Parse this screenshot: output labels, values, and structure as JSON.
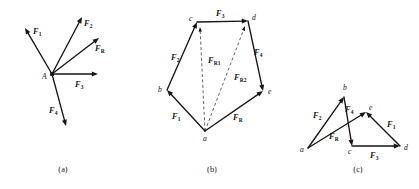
{
  "figure": {
    "background_color": "#ffffff",
    "line_color": "#161616",
    "dashed_color": "#4a4a4a",
    "width": 419,
    "height": 189
  },
  "panels": [
    {
      "id": "a",
      "caption": "(a)",
      "caption_x": 63,
      "caption_y": 172,
      "description": "Concurrent force system at point A",
      "origin": {
        "label": "A",
        "x": 52,
        "y": 74,
        "label_x": 42,
        "label_y": 79
      },
      "vectors": [
        {
          "name": "F1",
          "label": "F",
          "sub": "1",
          "x1": 52,
          "y1": 74,
          "x2": 25,
          "y2": 28,
          "label_x": 33,
          "label_y": 34,
          "style": "solid"
        },
        {
          "name": "F2",
          "label": "F",
          "sub": "2",
          "x1": 52,
          "y1": 74,
          "x2": 82,
          "y2": 17,
          "label_x": 84,
          "label_y": 26,
          "style": "solid"
        },
        {
          "name": "FR",
          "label": "F",
          "sub": "R",
          "x1": 52,
          "y1": 74,
          "x2": 99,
          "y2": 38,
          "label_x": 95,
          "label_y": 51,
          "style": "solid"
        },
        {
          "name": "F3",
          "label": "F",
          "sub": "3",
          "x1": 52,
          "y1": 74,
          "x2": 98,
          "y2": 74,
          "label_x": 75,
          "label_y": 87,
          "style": "solid"
        },
        {
          "name": "F4",
          "label": "F",
          "sub": "4",
          "x1": 52,
          "y1": 74,
          "x2": 66,
          "y2": 126,
          "label_x": 49,
          "label_y": 113,
          "style": "solid"
        }
      ],
      "points": [],
      "dashed": []
    },
    {
      "id": "b",
      "caption": "(b)",
      "caption_x": 212,
      "caption_y": 172,
      "description": "Force polygon a-b-c-d-e with partial resultants",
      "origin": null,
      "points": [
        {
          "label": "a",
          "x": 205,
          "y": 131,
          "label_x": 203,
          "label_y": 141
        },
        {
          "label": "b",
          "x": 167,
          "y": 90,
          "label_x": 158,
          "label_y": 92
        },
        {
          "label": "c",
          "x": 197,
          "y": 22,
          "label_x": 189,
          "label_y": 21
        },
        {
          "label": "d",
          "x": 248,
          "y": 21,
          "label_x": 252,
          "label_y": 20
        },
        {
          "label": "e",
          "x": 263,
          "y": 91,
          "label_x": 268,
          "label_y": 94
        }
      ],
      "vectors": [
        {
          "name": "F1",
          "label": "F",
          "sub": "1",
          "x1": 205,
          "y1": 131,
          "x2": 167,
          "y2": 90,
          "label_x": 172,
          "label_y": 119,
          "style": "solid"
        },
        {
          "name": "F2",
          "label": "F",
          "sub": "2",
          "x1": 167,
          "y1": 90,
          "x2": 197,
          "y2": 22,
          "label_x": 171,
          "label_y": 60,
          "style": "solid"
        },
        {
          "name": "F3",
          "label": "F",
          "sub": "3",
          "x1": 197,
          "y1": 22,
          "x2": 248,
          "y2": 21,
          "label_x": 216,
          "label_y": 16,
          "style": "solid"
        },
        {
          "name": "F4",
          "label": "F",
          "sub": "4",
          "x1": 248,
          "y1": 21,
          "x2": 263,
          "y2": 91,
          "label_x": 254,
          "label_y": 55,
          "style": "solid"
        },
        {
          "name": "FR",
          "label": "F",
          "sub": "R",
          "x1": 205,
          "y1": 131,
          "x2": 263,
          "y2": 91,
          "label_x": 233,
          "label_y": 120,
          "style": "solid"
        }
      ],
      "dashed": [
        {
          "name": "FR1",
          "label": "F",
          "sub": "R1",
          "x1": 205,
          "y1": 131,
          "x2": 200,
          "y2": 27,
          "label_x": 208,
          "label_y": 63
        },
        {
          "name": "FR2",
          "label": "F",
          "sub": "R2",
          "x1": 205,
          "y1": 131,
          "x2": 245,
          "y2": 26,
          "label_x": 234,
          "label_y": 80
        }
      ]
    },
    {
      "id": "c",
      "caption": "(c)",
      "caption_x": 358,
      "caption_y": 172,
      "description": "Crossed force polygon a-b-e-d-c with resultant",
      "origin": null,
      "points": [
        {
          "label": "a",
          "x": 308,
          "y": 148,
          "label_x": 300,
          "label_y": 152
        },
        {
          "label": "b",
          "x": 344,
          "y": 97,
          "label_x": 343,
          "label_y": 90
        },
        {
          "label": "c",
          "x": 352,
          "y": 146,
          "label_x": 348,
          "label_y": 154
        },
        {
          "label": "d",
          "x": 400,
          "y": 146,
          "label_x": 404,
          "label_y": 150
        },
        {
          "label": "e",
          "x": 366,
          "y": 112,
          "label_x": 369,
          "label_y": 110
        }
      ],
      "vectors": [
        {
          "name": "F2",
          "label": "F",
          "sub": "2",
          "x1": 308,
          "y1": 148,
          "x2": 344,
          "y2": 97,
          "label_x": 313,
          "label_y": 118,
          "style": "solid"
        },
        {
          "name": "F4",
          "label": "F",
          "sub": "4",
          "x1": 344,
          "y1": 97,
          "x2": 352,
          "y2": 146,
          "label_x": 345,
          "label_y": 112,
          "style": "solid"
        },
        {
          "name": "F3",
          "label": "F",
          "sub": "3",
          "x1": 352,
          "y1": 146,
          "x2": 400,
          "y2": 146,
          "label_x": 370,
          "label_y": 158,
          "style": "solid"
        },
        {
          "name": "F1",
          "label": "F",
          "sub": "1",
          "x1": 400,
          "y1": 146,
          "x2": 366,
          "y2": 112,
          "label_x": 387,
          "label_y": 127,
          "style": "solid"
        },
        {
          "name": "FR",
          "label": "F",
          "sub": "R",
          "x1": 308,
          "y1": 148,
          "x2": 366,
          "y2": 112,
          "label_x": 329,
          "label_y": 139,
          "style": "solid"
        }
      ],
      "dashed": []
    }
  ]
}
